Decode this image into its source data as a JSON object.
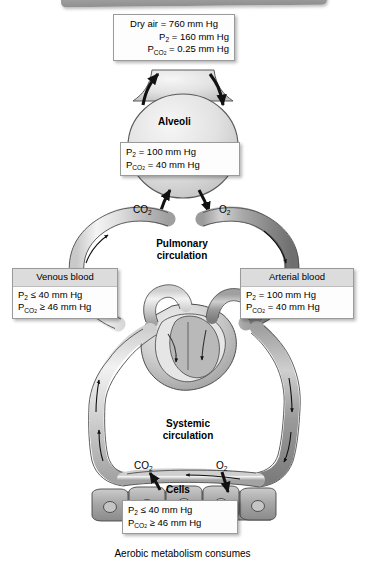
{
  "figure": {
    "title_bar": "",
    "caption": "Aerobic metabolism consumes"
  },
  "boxes": {
    "dry_air": {
      "name": "dry-air-box",
      "lines": [
        {
          "text": "Dry air = 760 mm Hg"
        },
        {
          "text": "P",
          "sub": "O2",
          "rest": " = 160 mm Hg"
        },
        {
          "text": "P",
          "sub": "CO2",
          "rest": " = 0.25 mm Hg"
        }
      ],
      "line1": "Dry air = 760 mm Hg",
      "line2_rest": " = 160 mm Hg",
      "line3_rest": " = 0.25 mm Hg"
    },
    "alveoli_gas": {
      "name": "alveoli-gas-box",
      "line1_rest": " = 100 mm Hg",
      "line2_rest": " = 40 mm Hg"
    },
    "venous_blood": {
      "name": "venous-blood-box",
      "header": "Venous blood",
      "line1_rest": " ≤ 40 mm Hg",
      "line2_rest": " ≥ 46 mm Hg"
    },
    "arterial_blood": {
      "name": "arterial-blood-box",
      "header": "Arterial blood",
      "line1_rest": " = 100 mm Hg",
      "line2_rest": " = 40 mm Hg"
    },
    "cells_gas": {
      "name": "cells-gas-box",
      "line1_rest": " ≤ 40 mm Hg",
      "line2_rest": " ≥ 46 mm Hg"
    }
  },
  "labels": {
    "alveoli": "Alveoli",
    "pulmonary_circulation_l1": "Pulmonary",
    "pulmonary_circulation_l2": "circulation",
    "systemic_circulation_l1": "Systemic",
    "systemic_circulation_l2": "circulation",
    "cells": "Cells",
    "co2_upper": "CO",
    "co2_upper_sub": "2",
    "o2_upper": "O",
    "o2_upper_sub": "2",
    "co2_lower": "CO",
    "co2_lower_sub": "2",
    "o2_lower": "O",
    "o2_lower_sub": "2",
    "p_symbol": "P",
    "sub_o2": "O2",
    "sub_co2": "CO2"
  },
  "colors": {
    "background": "#ffffff",
    "vessel_light": "#d9d9d9",
    "vessel_dark": "#8f8f8f",
    "outline": "#3a3a3a",
    "box_fill": "#fdfdfd",
    "box_header": "#dcdcdc",
    "top_bar": "#9c9c9c",
    "text": "#000000"
  }
}
